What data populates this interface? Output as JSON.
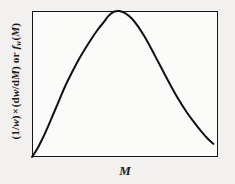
{
  "figure": {
    "name": "molecular-weight-distribution",
    "background_color": "#f2f1ef",
    "plot_background_color": "#fbfbfa",
    "frame_color": "#161616",
    "curve_color": "#111111"
  },
  "axes": {
    "xlabel": "M",
    "ylabel_full": "(1/w) × (dw/dM) or fᵥ(M)",
    "ylabel_parts": {
      "open_paren": "(1/",
      "w_var": "w",
      "close_paren": ")",
      "times": "×",
      "deriv_open": "(d",
      "deriv_w": "w",
      "deriv_slash": "/d",
      "deriv_M": "M",
      "deriv_close": ")",
      "conjunction": "or",
      "f_var": "f",
      "f_subscript": "w",
      "f_arg_open": "(",
      "f_arg": "M",
      "f_arg_close": ")"
    },
    "ticks_visible": false,
    "gridlines_visible": false
  },
  "chart_data": {
    "type": "line",
    "title": "",
    "subtitle": "",
    "xlabel": "M",
    "ylabel": "(1/w) × (dw/dM) or fᵥ(M)",
    "legend": [],
    "legend_position": "none",
    "grid": false,
    "xlim": [
      0,
      1
    ],
    "ylim": [
      0,
      1
    ],
    "x_tick_labels": [],
    "y_tick_labels": [],
    "series": [
      {
        "name": "distribution",
        "color": "#111111",
        "line_width": 2.0,
        "x": [
          0.0,
          0.03,
          0.06,
          0.09,
          0.12,
          0.15,
          0.18,
          0.215,
          0.25,
          0.285,
          0.32,
          0.355,
          0.39,
          0.41,
          0.44,
          0.47,
          0.5,
          0.535,
          0.57,
          0.605,
          0.64,
          0.675,
          0.71,
          0.75,
          0.79,
          0.83,
          0.87,
          0.91,
          0.945,
          0.975
        ],
        "y": [
          0.0,
          0.06,
          0.135,
          0.22,
          0.31,
          0.4,
          0.49,
          0.58,
          0.665,
          0.74,
          0.81,
          0.875,
          0.93,
          0.965,
          0.995,
          1.0,
          0.985,
          0.95,
          0.895,
          0.825,
          0.745,
          0.66,
          0.575,
          0.48,
          0.39,
          0.31,
          0.24,
          0.175,
          0.125,
          0.09
        ]
      }
    ],
    "annotations": [
      {
        "label": "peak",
        "x": 0.47,
        "y": 1.0
      },
      {
        "label": "origin",
        "x": 0.0,
        "y": 0.0
      }
    ]
  }
}
